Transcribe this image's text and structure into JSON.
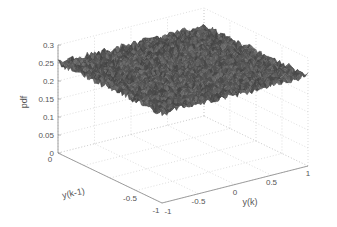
{
  "chart_data": {
    "type": "surface3d",
    "title": "",
    "xlabel": "y(k)",
    "ylabel": "y(k-1)",
    "zlabel": "pdf",
    "xlim": [
      -1,
      1
    ],
    "ylim": [
      -1,
      1
    ],
    "zlim": [
      0,
      0.3
    ],
    "x_ticks": [
      "-1",
      "-0.5",
      "0",
      "0.5",
      "1"
    ],
    "y_ticks": [
      "-1",
      "-0.5",
      "0"
    ],
    "z_ticks": [
      "0",
      "0.05",
      "0.1",
      "0.15",
      "0.2",
      "0.25",
      "0.3"
    ],
    "surface_level": 0.25,
    "surface_noise": 0.01,
    "grid": true,
    "colormap": "gray"
  }
}
